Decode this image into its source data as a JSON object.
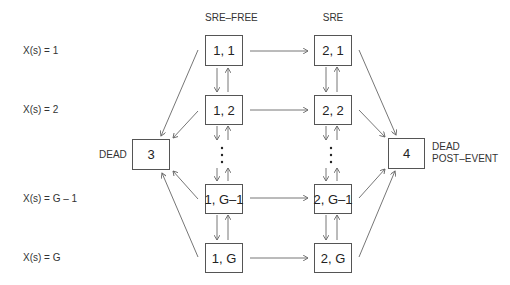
{
  "columns": {
    "sre_free": "SRE–FREE",
    "sre": "SRE"
  },
  "row_labels": [
    "X(s) = 1",
    "X(s) = 2",
    "X(s) = G – 1",
    "X(s) = G"
  ],
  "states": {
    "s11": "1, 1",
    "s12": "1, 2",
    "s1g1": "1, G–1",
    "s1g": "1, G",
    "s21": "2, 1",
    "s22": "2, 2",
    "s2g1": "2, G–1",
    "s2g": "2, G",
    "dead": "3",
    "dead_post": "4"
  },
  "dead_label": "DEAD",
  "dead_post_label_line1": "DEAD",
  "dead_post_label_line2": "POST–EVENT",
  "ellipsis": "⋮",
  "colors": {
    "line": "#666666",
    "box_border": "#555555",
    "text": "#222222"
  }
}
